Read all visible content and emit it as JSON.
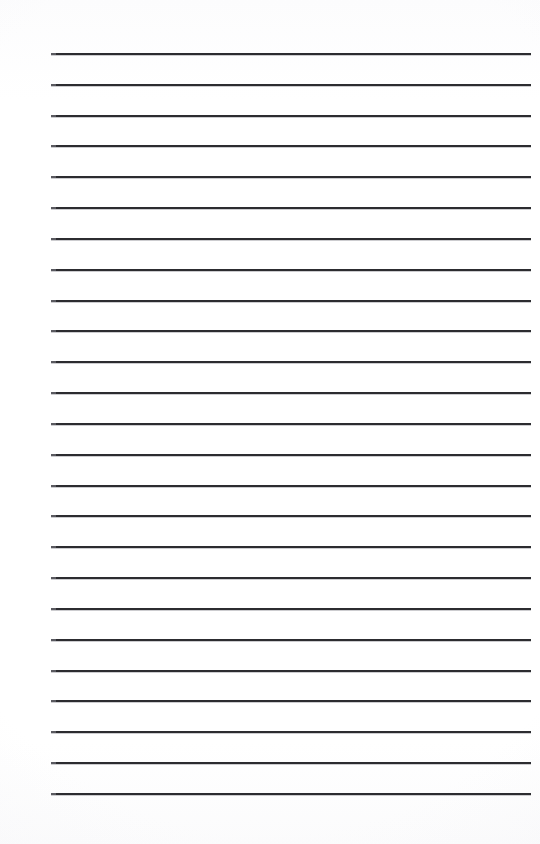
{
  "document": {
    "kind": "lined-paper",
    "title": "Blank Lined Notebook Page",
    "page_width": 540,
    "page_height": 844,
    "background_color": "#ffffff",
    "paper_tint": "#fdfdfd",
    "has_text_content": false,
    "visible_text": ""
  },
  "rules": {
    "count": 25,
    "color": "#2c2c30",
    "thickness_px": 2,
    "first_line_y": 53,
    "spacing_px": 30.83,
    "line_start_x": 51,
    "line_end_x": 531,
    "line_length_px": 480,
    "positions_y": [
      53,
      84,
      115,
      145,
      176,
      207,
      238,
      269,
      300,
      330,
      361,
      392,
      423,
      454,
      485,
      515,
      546,
      577,
      608,
      639,
      670,
      700,
      731,
      762,
      793
    ]
  },
  "margins": {
    "left_px": 51,
    "right_px": 9,
    "top_px": 53,
    "bottom_px": 51,
    "left_label": "left margin",
    "right_label": "right margin",
    "top_label": "top margin",
    "bottom_label": "bottom margin"
  }
}
